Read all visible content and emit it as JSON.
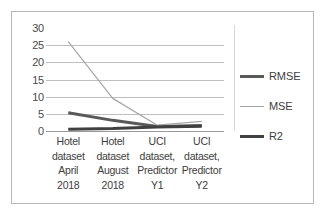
{
  "chart_data": {
    "type": "line",
    "title": "",
    "xlabel": "",
    "ylabel": "",
    "ylim": [
      0,
      30
    ],
    "yticks": [
      30,
      25,
      20,
      15,
      10,
      5,
      0
    ],
    "grid": true,
    "legend_position": "right",
    "categories": [
      "Hotel\ndataset\nApril\n2018",
      "Hotel\ndataset\nAugust\n2018",
      "UCI\ndataset,\nPredictor\nY1",
      "UCI\ndataset,\nPredictor\nY2"
    ],
    "series": [
      {
        "name": "RMSE",
        "values": [
          5.3,
          3.1,
          1.3,
          1.6
        ],
        "color": "#595959",
        "width": 3
      },
      {
        "name": "MSE",
        "values": [
          26.0,
          9.5,
          1.7,
          2.8
        ],
        "color": "#a6a6a6",
        "width": 1.2
      },
      {
        "name": "R2",
        "values": [
          0.5,
          0.7,
          1.2,
          1.4
        ],
        "color": "#404040",
        "width": 3
      }
    ]
  },
  "legend": {
    "items": [
      {
        "label": "RMSE"
      },
      {
        "label": "MSE"
      },
      {
        "label": "R2"
      }
    ]
  },
  "axis": {
    "y_tick_labels": [
      "30",
      "25",
      "20",
      "15",
      "10",
      "5",
      "0"
    ],
    "x_tick_labels": [
      "Hotel\ndataset\nApril\n2018",
      "Hotel\ndataset\nAugust\n2018",
      "UCI\ndataset,\nPredictor\nY1",
      "UCI\ndataset,\nPredictor\nY2"
    ]
  },
  "colors": {
    "rmse": "#595959",
    "mse": "#a6a6a6",
    "r2": "#404040",
    "grid": "#bfbfbf",
    "border": "#b8b8b8"
  }
}
